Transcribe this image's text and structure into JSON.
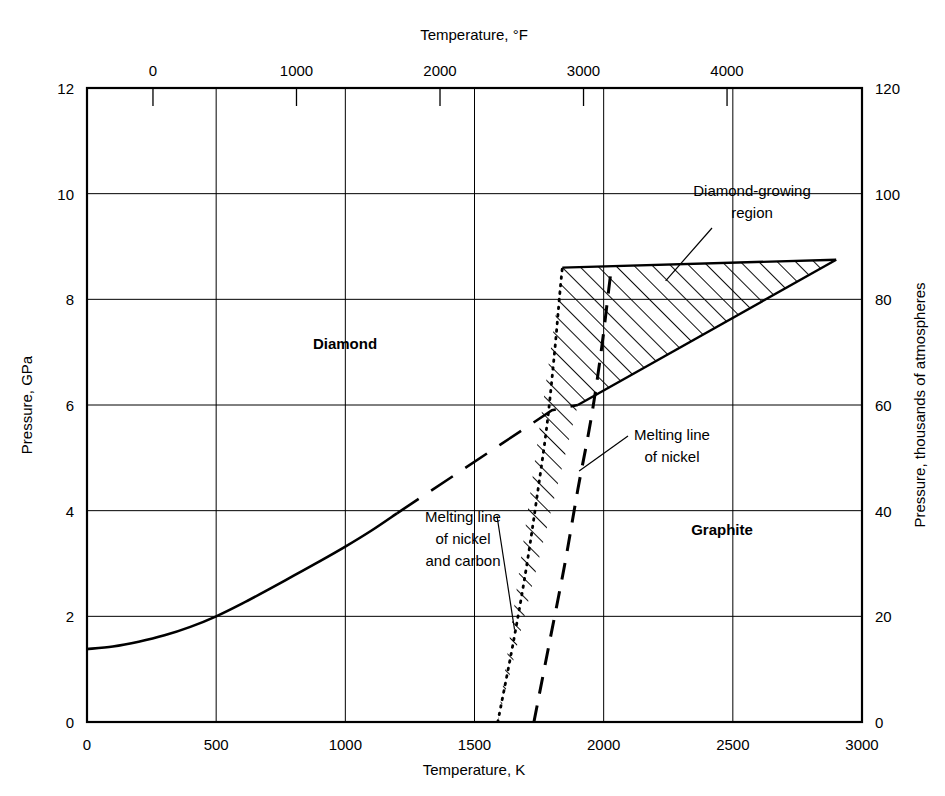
{
  "chart_data": {
    "type": "line",
    "axes": {
      "bottom": {
        "label": "Temperature, K",
        "min": 0,
        "max": 3000,
        "ticks": [
          0,
          500,
          1000,
          1500,
          2000,
          2500,
          3000
        ],
        "tick_labels": [
          "0",
          "500",
          "1000",
          "1500",
          "2000",
          "2500",
          "3000"
        ],
        "grid": true
      },
      "top": {
        "label": "Temperature, °F",
        "min": -459.67,
        "max": 4940.33,
        "ticks": [
          0,
          1000,
          2000,
          3000,
          4000
        ],
        "tick_labels": [
          "0",
          "1000",
          "2000",
          "3000",
          "4000"
        ],
        "grid": false
      },
      "left": {
        "label": "Pressure, GPa",
        "min": 0,
        "max": 12,
        "ticks": [
          0,
          2,
          4,
          6,
          8,
          10,
          12
        ],
        "tick_labels": [
          "0",
          "2",
          "4",
          "6",
          "8",
          "10",
          "12"
        ],
        "grid": true
      },
      "right": {
        "label": "Pressure, thousands of atmospheres",
        "min": 0,
        "max": 120,
        "ticks": [
          0,
          20,
          40,
          60,
          80,
          100,
          120
        ],
        "tick_labels": [
          "0",
          "20",
          "40",
          "60",
          "80",
          "100",
          "120"
        ],
        "grid": false
      }
    },
    "series": [
      {
        "name": "Diamond-graphite equilibrium (solid portion)",
        "style": "solid",
        "points": [
          [
            0,
            1.38
          ],
          [
            100,
            1.43
          ],
          [
            200,
            1.52
          ],
          [
            300,
            1.64
          ],
          [
            400,
            1.8
          ],
          [
            500,
            2.0
          ],
          [
            600,
            2.24
          ],
          [
            700,
            2.5
          ],
          [
            800,
            2.77
          ],
          [
            900,
            3.04
          ],
          [
            1000,
            3.32
          ],
          [
            1100,
            3.62
          ],
          [
            1200,
            3.95
          ]
        ]
      },
      {
        "name": "Diamond-graphite equilibrium (extrapolated, long-dashed)",
        "style": "long-dashed",
        "points": [
          [
            1200,
            3.95
          ],
          [
            1400,
            4.6
          ],
          [
            1600,
            5.25
          ],
          [
            1800,
            5.9
          ],
          [
            1900,
            6.0
          ]
        ]
      },
      {
        "name": "Melting line of nickel and carbon",
        "style": "dotted",
        "points": [
          [
            1590,
            0.0
          ],
          [
            1650,
            1.5
          ],
          [
            1700,
            2.9
          ],
          [
            1740,
            4.2
          ],
          [
            1780,
            5.6
          ],
          [
            1810,
            7.0
          ],
          [
            1830,
            8.1
          ],
          [
            1840,
            8.6
          ]
        ]
      },
      {
        "name": "Melting line of nickel",
        "style": "dashed",
        "points": [
          [
            1730,
            0.0
          ],
          [
            1790,
            1.5
          ],
          [
            1850,
            3.0
          ],
          [
            1900,
            4.4
          ],
          [
            1950,
            5.7
          ],
          [
            1990,
            7.0
          ],
          [
            2020,
            8.2
          ],
          [
            2030,
            8.6
          ]
        ]
      },
      {
        "name": "Diamond-growing region lower boundary",
        "style": "solid",
        "points": [
          [
            1900,
            6.0
          ],
          [
            2900,
            8.75
          ]
        ]
      },
      {
        "name": "Diamond-growing region upper boundary",
        "style": "solid",
        "points": [
          [
            1840,
            8.6
          ],
          [
            2900,
            8.75
          ]
        ]
      }
    ],
    "shaded_regions": [
      {
        "name": "Diamond-growing region",
        "fill": "hatched",
        "vertices": [
          [
            1840,
            8.6
          ],
          [
            2900,
            8.75
          ],
          [
            1900,
            6.0
          ],
          [
            1590,
            0.0
          ]
        ]
      }
    ],
    "region_labels": [
      {
        "text": "Diamond",
        "x": 1000,
        "y": 7.1
      },
      {
        "text": "Graphite",
        "x": 2400,
        "y": 3.5
      }
    ],
    "annotations": [
      {
        "text": "Diamond-growing\nregion",
        "lines": [
          "Diamond-growing",
          "region"
        ],
        "target_x": 2240,
        "target_y": 8.35
      },
      {
        "text": "Melting line\nof nickel\nand carbon",
        "lines": [
          "Melting line",
          "of nickel",
          "and carbon"
        ],
        "target_x": 1650,
        "target_y": 1.6
      },
      {
        "text": "Melting line\nof nickel",
        "lines": [
          "Melting line",
          "of nickel"
        ],
        "target_x": 1910,
        "target_y": 4.6
      }
    ]
  },
  "labels": {
    "top_axis_title": "Temperature, °F",
    "bottom_axis_title": "Temperature, K",
    "left_axis_title": "Pressure, GPa",
    "right_axis_title": "Pressure, thousands of atmospheres",
    "diamond": "Diamond",
    "graphite": "Graphite",
    "diamond_growing_line1": "Diamond-growing",
    "diamond_growing_line2": "region",
    "melting_nc_line1": "Melting line",
    "melting_nc_line2": "of nickel",
    "melting_nc_line3": "and carbon",
    "melting_ni_line1": "Melting line",
    "melting_ni_line2": "of nickel"
  },
  "ticks": {
    "bottom": [
      "0",
      "500",
      "1000",
      "1500",
      "2000",
      "2500",
      "3000"
    ],
    "top": [
      "0",
      "1000",
      "2000",
      "3000",
      "4000"
    ],
    "left": [
      "0",
      "2",
      "4",
      "6",
      "8",
      "10",
      "12"
    ],
    "right": [
      "0",
      "20",
      "40",
      "60",
      "80",
      "100",
      "120"
    ]
  },
  "colors": {
    "line": "#000000",
    "grid": "#000000",
    "background": "#ffffff"
  }
}
